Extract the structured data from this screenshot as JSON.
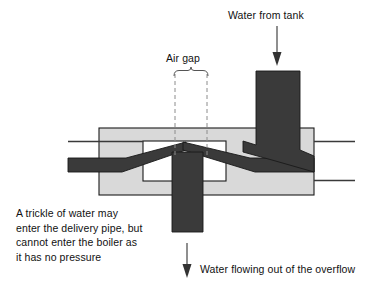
{
  "diagram": {
    "title_absent": true,
    "labels": {
      "water_from_tank": "Water from tank",
      "air_gap": "Air gap",
      "trickle_note": "A trickle of water may\nenter the delivery pipe, but\ncannot enter the boiler as\nit has no pressure",
      "overflow": "Water flowing out of the overflow"
    },
    "colors": {
      "pipe_dark": "#3a3a3a",
      "body_fill": "#d9d9d9",
      "body_stroke": "#1a1a1a",
      "chamber_fill": "#ffffff",
      "dashed_line": "#8c8c8c",
      "text": "#111111",
      "background": "#ffffff"
    },
    "parts": [
      {
        "name": "valve-body",
        "description": "outer grey rectangular housing"
      },
      {
        "name": "inner-chamber",
        "description": "white chamber inside housing"
      },
      {
        "name": "inlet-pipe",
        "description": "vertical dark pipe entering from tank at top right"
      },
      {
        "name": "overflow-pipe",
        "description": "vertical dark pipe leaving downward at centre"
      },
      {
        "name": "left-wedge",
        "description": "tapered dark delivery pipe entering from left"
      },
      {
        "name": "right-wedge",
        "description": "tapered dark pipe exiting to the right"
      },
      {
        "name": "air-gap-brace",
        "description": "curly brace spanning the air gap"
      },
      {
        "name": "air-gap-dashes",
        "description": "pair of vertical dashed lines marking the gap"
      }
    ],
    "arrows": [
      {
        "name": "inflow-arrow",
        "direction": "down",
        "meaning": "Water from tank"
      },
      {
        "name": "outflow-arrow",
        "direction": "down",
        "meaning": "Water flowing out of the overflow"
      }
    ]
  }
}
